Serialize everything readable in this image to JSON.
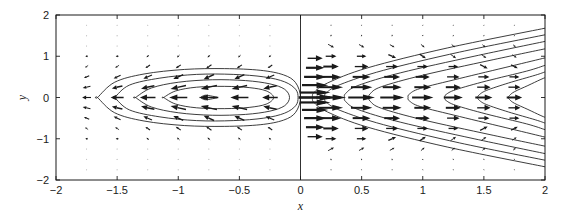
{
  "figure": {
    "background_color": "#ffffff",
    "frame_color": "#1a1a1a",
    "contour_color": "#1a1a1a",
    "arrow_color": "#1a1a1a",
    "grid_dot_color": "#c8c8c8"
  },
  "chart_data": {
    "type": "line",
    "title": "",
    "subtitle": "",
    "xlabel": "x",
    "ylabel": "y",
    "xlim": [
      -2,
      2
    ],
    "ylim": [
      -2,
      2
    ],
    "xticks": [
      -2,
      -1.5,
      -1,
      -0.5,
      0,
      0.5,
      1,
      1.5,
      2
    ],
    "xticklabels": [
      "-2",
      "-1.5",
      "-1",
      "-0.5",
      "0",
      "0.5",
      "1",
      "1.5",
      "2"
    ],
    "yticks": [
      -2,
      -1,
      0,
      1,
      2
    ],
    "yticklabels": [
      "-2",
      "-1",
      "0",
      "1",
      "2"
    ],
    "grid": "dotted",
    "legend": "none",
    "annotations": [],
    "discontinuity_line_x": 0,
    "grid_dots": {
      "x_values": [
        -1.75,
        -1.5,
        -1.25,
        -1,
        -0.75,
        -0.5,
        -0.25,
        0.25,
        0.5,
        0.75,
        1,
        1.25,
        1.5,
        1.75
      ],
      "y_values": [
        -1.75,
        -1.5,
        -1.25,
        -1,
        -0.75,
        -0.5,
        -0.25,
        0,
        0.25,
        0.5,
        0.75,
        1,
        1.25,
        1.5,
        1.75
      ]
    },
    "series": [
      {
        "name": "left-contour-1",
        "region": "left",
        "level": 1,
        "closed": true,
        "x": [
          -0.82,
          -0.78,
          -0.72,
          -0.68,
          -0.72,
          -0.78,
          -0.82
        ],
        "y": [
          0.0,
          0.055,
          0.03,
          0.0,
          -0.03,
          -0.055,
          0.0
        ]
      },
      {
        "name": "left-contour-2",
        "region": "left",
        "level": 2,
        "closed": true,
        "x": [
          -1.12,
          -1.02,
          -0.85,
          -0.62,
          -0.42,
          -0.28,
          -0.22,
          -0.28,
          -0.42,
          -0.62,
          -0.85,
          -1.02,
          -1.12
        ],
        "y": [
          0.0,
          0.16,
          0.25,
          0.27,
          0.24,
          0.16,
          0.0,
          -0.16,
          -0.24,
          -0.27,
          -0.25,
          -0.16,
          0.0
        ]
      },
      {
        "name": "left-contour-3",
        "region": "left",
        "level": 3,
        "closed": true,
        "x": [
          -1.35,
          -1.22,
          -1.0,
          -0.72,
          -0.45,
          -0.25,
          -0.13,
          -0.09,
          -0.13,
          -0.25,
          -0.45,
          -0.72,
          -1.0,
          -1.22,
          -1.35
        ],
        "y": [
          0.0,
          0.23,
          0.37,
          0.43,
          0.41,
          0.33,
          0.2,
          0.0,
          -0.2,
          -0.33,
          -0.41,
          -0.43,
          -0.37,
          -0.23,
          0.0
        ]
      },
      {
        "name": "left-contour-4",
        "region": "left",
        "level": 4,
        "closed": true,
        "x": [
          -1.52,
          -1.4,
          -1.15,
          -0.85,
          -0.55,
          -0.3,
          -0.13,
          -0.04,
          -0.02,
          -0.04,
          -0.13,
          -0.3,
          -0.55,
          -0.85,
          -1.15,
          -1.4,
          -1.52
        ],
        "y": [
          0.0,
          0.3,
          0.47,
          0.56,
          0.56,
          0.5,
          0.38,
          0.2,
          0.0,
          -0.2,
          -0.38,
          -0.5,
          -0.56,
          -0.56,
          -0.47,
          -0.3,
          0.0
        ]
      },
      {
        "name": "left-contour-5",
        "region": "left",
        "level": 5,
        "closed": true,
        "x": [
          -1.66,
          -1.52,
          -1.28,
          -0.95,
          -0.62,
          -0.33,
          -0.14,
          -0.04,
          0.0,
          -0.04,
          -0.14,
          -0.33,
          -0.62,
          -0.95,
          -1.28,
          -1.52,
          -1.66
        ],
        "y": [
          0.0,
          0.37,
          0.57,
          0.68,
          0.7,
          0.66,
          0.55,
          0.36,
          0.0,
          -0.36,
          -0.55,
          -0.66,
          -0.7,
          -0.68,
          -0.57,
          -0.37,
          0.0
        ]
      },
      {
        "name": "right-contour-1",
        "region": "right",
        "level": 1,
        "vertex_x": 0.1,
        "x": [
          2.0,
          1.2,
          0.55,
          0.22,
          0.11,
          0.1,
          0.11,
          0.22,
          0.55,
          1.2,
          2.0
        ],
        "y": [
          1.68,
          1.2,
          0.72,
          0.35,
          0.12,
          0.0,
          -0.12,
          -0.35,
          -0.72,
          -1.2,
          -1.68
        ]
      },
      {
        "name": "right-contour-2",
        "region": "right",
        "level": 2,
        "vertex_x": 0.2,
        "x": [
          2.0,
          1.3,
          0.68,
          0.33,
          0.21,
          0.2,
          0.21,
          0.33,
          0.68,
          1.3,
          2.0
        ],
        "y": [
          1.52,
          1.1,
          0.66,
          0.32,
          0.11,
          0.0,
          -0.11,
          -0.32,
          -0.66,
          -1.1,
          -1.52
        ]
      },
      {
        "name": "right-contour-3",
        "region": "right",
        "level": 3,
        "vertex_x": 0.36,
        "x": [
          2.0,
          1.42,
          0.82,
          0.47,
          0.37,
          0.36,
          0.37,
          0.47,
          0.82,
          1.42,
          2.0
        ],
        "y": [
          1.36,
          1.0,
          0.6,
          0.29,
          0.1,
          0.0,
          -0.1,
          -0.29,
          -0.6,
          -1.0,
          -1.36
        ]
      },
      {
        "name": "right-contour-4",
        "region": "right",
        "level": 4,
        "vertex_x": 0.56,
        "x": [
          2.0,
          1.55,
          1.0,
          0.66,
          0.57,
          0.56,
          0.57,
          0.66,
          1.0,
          1.55,
          2.0
        ],
        "y": [
          1.18,
          0.9,
          0.54,
          0.26,
          0.09,
          0.0,
          -0.09,
          -0.26,
          -0.54,
          -0.9,
          -1.18
        ]
      },
      {
        "name": "right-contour-5",
        "region": "right",
        "level": 5,
        "vertex_x": 0.88,
        "x": [
          2.0,
          1.72,
          1.3,
          0.98,
          0.89,
          0.88,
          0.89,
          0.98,
          1.3,
          1.72,
          2.0
        ],
        "y": [
          0.96,
          0.76,
          0.46,
          0.22,
          0.08,
          0.0,
          -0.08,
          -0.22,
          -0.46,
          -0.76,
          -0.96
        ]
      },
      {
        "name": "right-contour-6",
        "region": "right",
        "level": 6,
        "vertex_x": 1.18,
        "x": [
          2.0,
          1.85,
          1.52,
          1.27,
          1.19,
          1.18,
          1.19,
          1.27,
          1.52,
          1.85,
          2.0
        ],
        "y": [
          0.78,
          0.64,
          0.4,
          0.19,
          0.07,
          0.0,
          -0.07,
          -0.19,
          -0.4,
          -0.64,
          -0.78
        ]
      },
      {
        "name": "right-contour-7",
        "region": "right",
        "level": 7,
        "vertex_x": 1.45,
        "x": [
          2.0,
          1.92,
          1.7,
          1.52,
          1.46,
          1.45,
          1.46,
          1.52,
          1.7,
          1.92,
          2.0
        ],
        "y": [
          0.62,
          0.54,
          0.35,
          0.17,
          0.06,
          0.0,
          -0.06,
          -0.17,
          -0.35,
          -0.54,
          -0.62
        ]
      },
      {
        "name": "right-contour-8",
        "region": "right",
        "level": 8,
        "vertex_x": 1.7,
        "x": [
          2.0,
          1.96,
          1.86,
          1.75,
          1.71,
          1.7,
          1.71,
          1.75,
          1.86,
          1.96,
          2.0
        ],
        "y": [
          0.48,
          0.43,
          0.29,
          0.14,
          0.05,
          0.0,
          -0.05,
          -0.14,
          -0.29,
          -0.43,
          -0.48
        ]
      }
    ],
    "vector_field": {
      "description": "Arrows in the left region point to the left (negative x); arrows in the right region point to the right (positive x). Arrow magnitude is largest near the x = 0 discontinuity and near y = 0.",
      "grid_x": [
        -1.75,
        -1.5,
        -1.25,
        -1,
        -0.75,
        -0.5,
        -0.25,
        0.25,
        0.5,
        0.75,
        1,
        1.25,
        1.5,
        1.75
      ],
      "grid_y": [
        -1.75,
        -1.5,
        -1.25,
        -1,
        -0.75,
        -0.5,
        -0.25,
        0,
        0.25,
        0.5,
        0.75,
        1,
        1.25,
        1.5,
        1.75
      ]
    }
  }
}
